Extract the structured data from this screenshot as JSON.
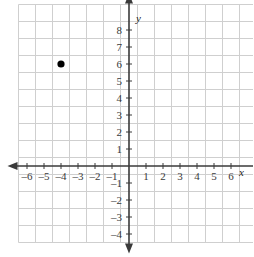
{
  "figure": {
    "background_color": "#ffffff",
    "grid_color": "#cfcfcf",
    "axis_color": "#3a3a3a",
    "point_color": "#000000",
    "label_color": "#3a3a3a"
  },
  "chart_data": {
    "type": "scatter",
    "title": "",
    "xlabel": "x",
    "ylabel": "y",
    "xlim": [
      -7,
      7
    ],
    "ylim": [
      -5,
      9
    ],
    "grid": true,
    "legend": "none",
    "x_tick_labels": [
      "–6",
      "–5",
      "–4",
      "–3",
      "–2",
      "–1",
      "1",
      "2",
      "3",
      "4",
      "5",
      "6"
    ],
    "x_tick_values": [
      -6,
      -5,
      -4,
      -3,
      -2,
      -1,
      1,
      2,
      3,
      4,
      5,
      6
    ],
    "y_tick_labels": [
      "8",
      "7",
      "6",
      "5",
      "4",
      "3",
      "2",
      "1",
      "–1",
      "–2",
      "–3",
      "–4"
    ],
    "y_tick_values": [
      8,
      7,
      6,
      5,
      4,
      3,
      2,
      1,
      -1,
      -2,
      -3,
      -4
    ],
    "points": [
      {
        "label": "(–4, 6)",
        "x": -4,
        "y": 6
      }
    ],
    "series": [
      {
        "name": "plotted point",
        "x": [
          -4
        ],
        "y": [
          6
        ]
      }
    ]
  },
  "axes": {
    "x_axis_label": "x",
    "y_axis_label": "y"
  }
}
